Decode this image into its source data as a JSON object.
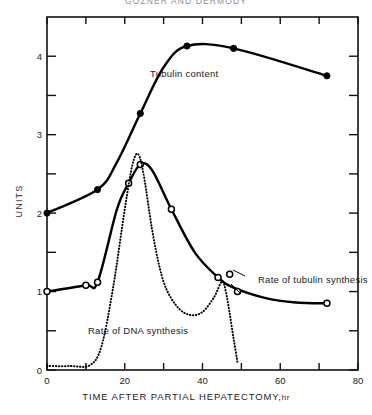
{
  "figure": {
    "title": "GOZNER AND DERMODY",
    "y_axis_label": "UNITS",
    "x_axis_label": "TIME AFTER PARTIAL HEPATECTOMY,",
    "x_axis_unit": "hr"
  },
  "axes": {
    "x_ticks_major": [
      "0",
      "20",
      "40",
      "60",
      "80"
    ],
    "x_tick_values_major": [
      0,
      20,
      40,
      60,
      80
    ],
    "x_tick_values_minor": [
      10,
      30,
      50,
      70
    ],
    "y_ticks_major": [
      "0",
      "1",
      "2",
      "3",
      "4"
    ],
    "y_tick_values_major": [
      0,
      1,
      2,
      3,
      4
    ],
    "y_tick_values_minor": [
      0.5,
      1.5,
      2.5,
      3.5
    ]
  },
  "labels": {
    "tubulin_content": "Tubulin content",
    "rate_tubulin_synthesis": "Rate of tubulin synthesis",
    "rate_dna_synthesis": "Rate of DNA synthesis"
  },
  "colors": {
    "ink": "#000000",
    "axis": "#111111",
    "title": "#8e8e95",
    "background": "#ffffff"
  },
  "chart_data": {
    "type": "line",
    "title": "GOZNER AND DERMODY",
    "xlabel": "TIME AFTER PARTIAL HEPATECTOMY, hr",
    "ylabel": "UNITS",
    "xlim": [
      0,
      80
    ],
    "ylim": [
      0,
      4.5
    ],
    "grid": false,
    "legend": "inline-annotations",
    "series": [
      {
        "name": "Tubulin content",
        "style": "solid-line-filled-circle-markers",
        "marker": "filled-circle",
        "points": [
          {
            "x": 0,
            "y": 2.0
          },
          {
            "x": 13,
            "y": 2.3
          },
          {
            "x": 18,
            "y": 2.65
          },
          {
            "x": 24,
            "y": 3.27
          },
          {
            "x": 30,
            "y": 3.86
          },
          {
            "x": 36,
            "y": 4.13
          },
          {
            "x": 48,
            "y": 4.1
          },
          {
            "x": 72,
            "y": 3.75
          }
        ],
        "marker_points": [
          {
            "x": 0,
            "y": 2.0
          },
          {
            "x": 13,
            "y": 2.3
          },
          {
            "x": 24,
            "y": 3.27
          },
          {
            "x": 36,
            "y": 4.13
          },
          {
            "x": 48,
            "y": 4.1
          },
          {
            "x": 72,
            "y": 3.75
          }
        ]
      },
      {
        "name": "Rate of tubulin synthesis",
        "style": "solid-line-open-circle-markers",
        "marker": "open-circle",
        "points": [
          {
            "x": 0,
            "y": 1.0
          },
          {
            "x": 10,
            "y": 1.08
          },
          {
            "x": 13,
            "y": 1.12
          },
          {
            "x": 18,
            "y": 2.05
          },
          {
            "x": 21,
            "y": 2.38
          },
          {
            "x": 24,
            "y": 2.62
          },
          {
            "x": 27,
            "y": 2.55
          },
          {
            "x": 32,
            "y": 2.05
          },
          {
            "x": 38,
            "y": 1.5
          },
          {
            "x": 44,
            "y": 1.18
          },
          {
            "x": 48,
            "y": 1.05
          },
          {
            "x": 56,
            "y": 0.92
          },
          {
            "x": 64,
            "y": 0.86
          },
          {
            "x": 72,
            "y": 0.85
          }
        ],
        "marker_points": [
          {
            "x": 0,
            "y": 1.0
          },
          {
            "x": 10,
            "y": 1.08
          },
          {
            "x": 13,
            "y": 1.12
          },
          {
            "x": 21,
            "y": 2.38
          },
          {
            "x": 24,
            "y": 2.62
          },
          {
            "x": 32,
            "y": 2.05
          },
          {
            "x": 44,
            "y": 1.18
          },
          {
            "x": 47,
            "y": 1.22
          },
          {
            "x": 49,
            "y": 1.0
          },
          {
            "x": 72,
            "y": 0.85
          }
        ]
      },
      {
        "name": "Rate of DNA synthesis",
        "style": "dotted-line",
        "marker": "none",
        "points": [
          {
            "x": 0,
            "y": 0.05
          },
          {
            "x": 6,
            "y": 0.05
          },
          {
            "x": 11,
            "y": 0.06
          },
          {
            "x": 14,
            "y": 0.3
          },
          {
            "x": 17,
            "y": 1.05
          },
          {
            "x": 20,
            "y": 2.05
          },
          {
            "x": 22,
            "y": 2.62
          },
          {
            "x": 23.5,
            "y": 2.75
          },
          {
            "x": 25,
            "y": 2.45
          },
          {
            "x": 27,
            "y": 1.8
          },
          {
            "x": 29,
            "y": 1.3
          },
          {
            "x": 31,
            "y": 1.0
          },
          {
            "x": 34,
            "y": 0.78
          },
          {
            "x": 37,
            "y": 0.7
          },
          {
            "x": 40,
            "y": 0.74
          },
          {
            "x": 43,
            "y": 0.93
          },
          {
            "x": 45,
            "y": 1.13
          },
          {
            "x": 46,
            "y": 1.0
          },
          {
            "x": 47,
            "y": 0.72
          },
          {
            "x": 48,
            "y": 0.4
          },
          {
            "x": 49,
            "y": 0.1
          }
        ]
      }
    ]
  }
}
